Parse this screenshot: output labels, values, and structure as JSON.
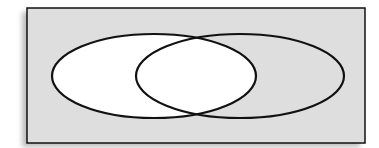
{
  "diagram": {
    "type": "venn",
    "colors": {
      "universe_fill": "#dedede",
      "shaded_region_fill": "#ffffff",
      "outline": "#111111",
      "shadow": "#bdbdbd"
    },
    "universe": {
      "x": 27,
      "y": 8,
      "width": 338,
      "height": 135
    },
    "sets": [
      {
        "id": "A",
        "cx": 154,
        "cy": 76,
        "rx": 102,
        "ry": 42,
        "highlighted": true
      },
      {
        "id": "B",
        "cx": 240,
        "cy": 76,
        "rx": 104,
        "ry": 42,
        "highlighted": false
      }
    ],
    "highlighted_region": "A"
  }
}
